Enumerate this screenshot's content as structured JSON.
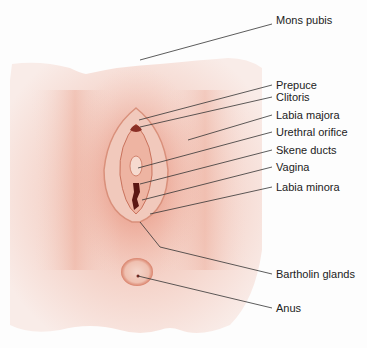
{
  "diagram": {
    "colors": {
      "skin": "#f7e6e0",
      "flush": "#e89a85",
      "line": "#333333",
      "text": "#222222"
    },
    "labels": [
      {
        "id": "mons-pubis",
        "text": "Mons pubis",
        "x": 276,
        "y": 20
      },
      {
        "id": "prepuce",
        "text": "Prepuce",
        "x": 277,
        "y": 81
      },
      {
        "id": "clitoris",
        "text": "Clitoris",
        "x": 277,
        "y": 93
      },
      {
        "id": "labia-majora",
        "text": "Labia majora",
        "x": 277,
        "y": 111
      },
      {
        "id": "urethral-orifice",
        "text": "Urethral orifice",
        "x": 277,
        "y": 128
      },
      {
        "id": "skene-ducts",
        "text": "Skene ducts",
        "x": 277,
        "y": 146
      },
      {
        "id": "vagina",
        "text": "Vagina",
        "x": 277,
        "y": 163
      },
      {
        "id": "labia-minora",
        "text": "Labia minora",
        "x": 277,
        "y": 183
      },
      {
        "id": "bartholin-glands",
        "text": "Bartholin glands",
        "x": 277,
        "y": 270
      },
      {
        "id": "anus",
        "text": "Anus",
        "x": 277,
        "y": 304
      }
    ]
  }
}
